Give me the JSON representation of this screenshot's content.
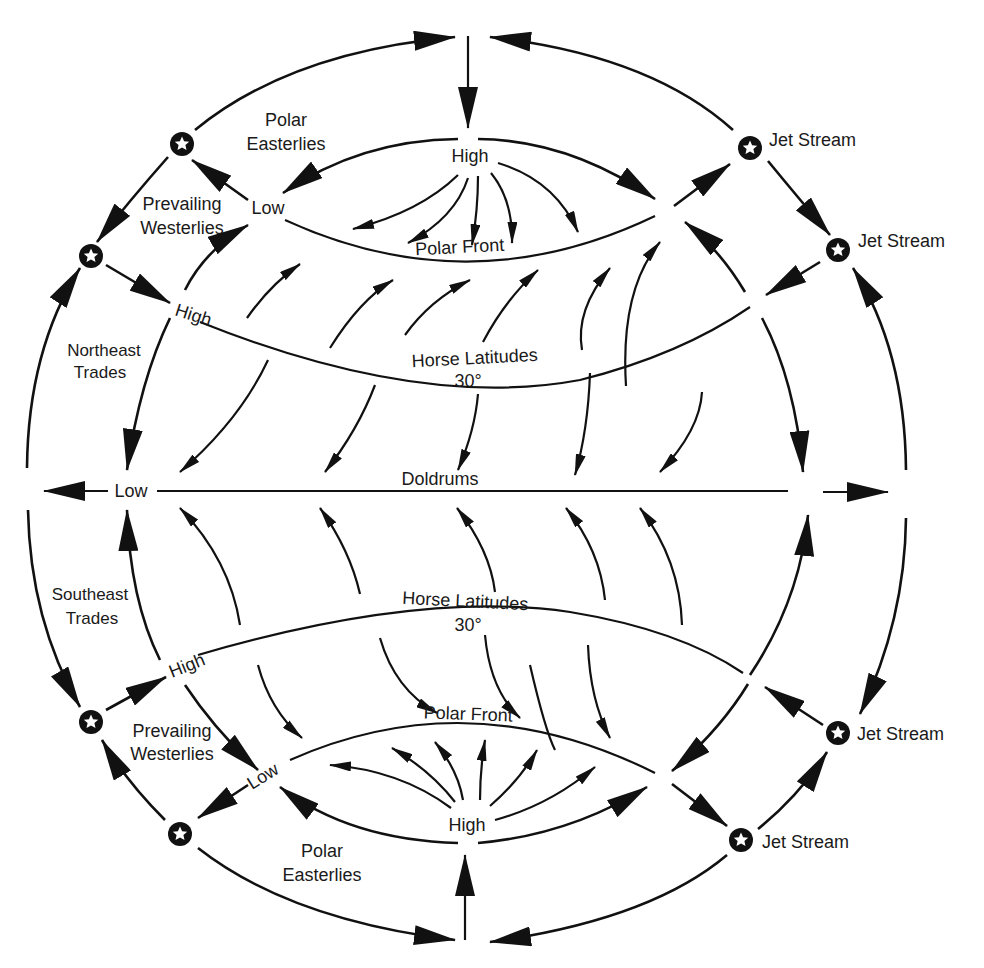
{
  "diagram": {
    "colors": {
      "ink": "#111111",
      "background": "#ffffff"
    },
    "labels": {
      "north_polar_easterlies_1": "Polar",
      "north_polar_easterlies_2": "Easterlies",
      "north_high_pole": "High",
      "north_low": "Low",
      "north_prevailing_westerlies_1": "Prevailing",
      "north_prevailing_westerlies_2": "Westerlies",
      "north_polar_front": "Polar Front",
      "north_high_subtropic": "High",
      "northeast_trades_1": "Northeast",
      "northeast_trades_2": "Trades",
      "north_horse_latitudes": "Horse Latitudes",
      "north_30deg": "30°",
      "equator_low": "Low",
      "doldrums": "Doldrums",
      "southeast_trades_1": "Southeast",
      "southeast_trades_2": "Trades",
      "south_horse_latitudes": "Horse Latitudes",
      "south_30deg": "30°",
      "south_high_subtropic": "High",
      "south_prevailing_westerlies_1": "Prevailing",
      "south_prevailing_westerlies_2": "Westerlies",
      "south_polar_front": "Polar Front",
      "south_low": "Low",
      "south_high_pole": "High",
      "south_polar_easterlies_1": "Polar",
      "south_polar_easterlies_2": "Easterlies",
      "jet_stream_ne_upper": "Jet Stream",
      "jet_stream_ne_lower": "Jet Stream",
      "jet_stream_se_upper": "Jet Stream",
      "jet_stream_se_lower": "Jet Stream"
    },
    "icons": {
      "jet_stream_marker": "star-in-circle-icon"
    }
  }
}
